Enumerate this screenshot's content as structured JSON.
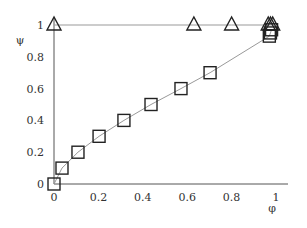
{
  "chart_data": {
    "type": "scatter",
    "title": "",
    "xlabel": "φ",
    "ylabel": "ψ",
    "xlim": [
      0,
      1
    ],
    "ylim": [
      0,
      1
    ],
    "grid": false,
    "legend": null,
    "x_ticks": [
      "0",
      "0.2",
      "0.4",
      "0.6",
      "0.8",
      "1"
    ],
    "y_ticks": [
      "0",
      "0.2",
      "0.4",
      "0.6",
      "0.8",
      "1"
    ],
    "series": [
      {
        "name": "squares",
        "marker": "square",
        "line": true,
        "line_color": "#999999",
        "points": [
          {
            "x": 0.0,
            "y": 0.0
          },
          {
            "x": 0.036,
            "y": 0.1
          },
          {
            "x": 0.108,
            "y": 0.2
          },
          {
            "x": 0.203,
            "y": 0.3
          },
          {
            "x": 0.315,
            "y": 0.4
          },
          {
            "x": 0.437,
            "y": 0.5
          },
          {
            "x": 0.572,
            "y": 0.6
          },
          {
            "x": 0.703,
            "y": 0.7
          },
          {
            "x": 0.97,
            "y": 0.93
          },
          {
            "x": 0.975,
            "y": 0.95
          },
          {
            "x": 0.98,
            "y": 0.97
          }
        ]
      },
      {
        "name": "triangles",
        "marker": "triangle",
        "line": true,
        "line_color": "#999999",
        "points": [
          {
            "x": 0.0,
            "y": 1.0
          },
          {
            "x": 0.63,
            "y": 1.0
          },
          {
            "x": 0.8,
            "y": 1.0
          },
          {
            "x": 0.965,
            "y": 1.0
          },
          {
            "x": 0.975,
            "y": 1.0
          },
          {
            "x": 0.985,
            "y": 1.0
          }
        ]
      }
    ]
  },
  "axes": {
    "x_label": "φ",
    "y_label": "ψ",
    "x_tick_labels": [
      "0",
      "0.2",
      "0.4",
      "0.6",
      "0.8",
      "1"
    ],
    "y_tick_labels": [
      "0",
      "0.2",
      "0.4",
      "0.6",
      "0.8",
      "1"
    ]
  }
}
